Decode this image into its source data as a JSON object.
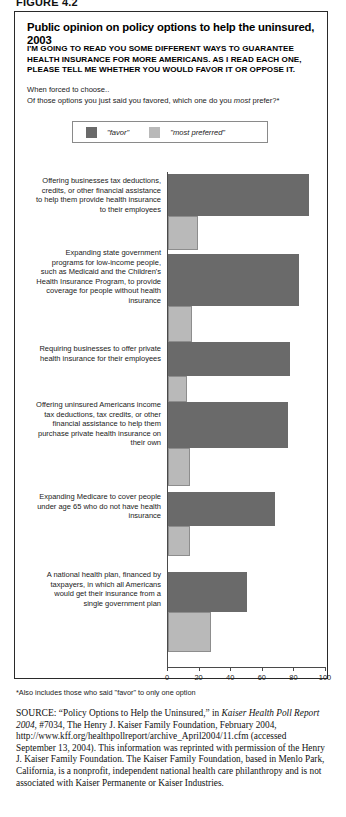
{
  "figure_tag": "FIGURE 4.2",
  "panel": {
    "title": "Public opinion on policy options to help the uninsured, 2003",
    "subtitle": "I'M GOING TO READ YOU SOME DIFFERENT WAYS TO GUARANTEE HEALTH INSURANCE FOR MORE AMERICANS. AS I READ EACH ONE, PLEASE TELL ME WHETHER YOU WOULD FAVOR IT OR OPPOSE IT.",
    "intro_line1": "When forced to choose..",
    "intro_line2_a": "Of those options you just said you favored, which one do you ",
    "intro_line2_em": "most",
    "intro_line2_b": " prefer?*"
  },
  "legend": {
    "favor_label": "\"favor\"",
    "preferred_label": "\"most preferred\"",
    "favor_color": "#6a6a6a",
    "preferred_color": "#b9b9b9"
  },
  "footnote": "*Also includes those who said \"favor\" to only one option",
  "source": {
    "prefix": "SOURCE:",
    "text_1": " “Policy Options to Help the Uninsured,” in ",
    "italic_1": "Kaiser Health Poll Report 2004",
    "text_2": ", #7034, The Henry J. Kaiser Family Foundation, February 2004, http://www.kff.org/healthpollreport/archive_April2004/11.cfm (accessed September 13, 2004). This information was reprinted with permission of the Henry J. Kaiser Family Foundation. The Kaiser Family Foundation, based in Menlo Park, California, is a nonprofit, independent national health care philanthropy and is not associated with Kaiser Permanente or Kaiser Industries."
  },
  "chart_data": {
    "type": "bar",
    "orientation": "horizontal",
    "title": "Public opinion on policy options to help the uninsured, 2003",
    "xlabel": "",
    "ylabel": "",
    "xlim": [
      0,
      100
    ],
    "xticks": [
      0,
      20,
      40,
      60,
      80,
      100
    ],
    "grid": false,
    "legend_position": "top",
    "categories": [
      "Offering businesses tax deductions, credits, or other financial assistance to help them provide health insurance to their employees",
      "Expanding state government programs for low-income people, such as Medicaid and the Children's Health Insurance Program, to provide coverage for people without health insurance",
      "Requiring businesses to offer private health insurance for their employees",
      "Offering uninsured Americans income tax deductions, tax credits, or other financial assistance to help them purchase private health insurance on their own",
      "Expanding Medicare to cover people under age 65 who do not have health insurance",
      "A national health plan, financed by taxpayers, in which all Americans would get their insurance from a single government plan"
    ],
    "series": [
      {
        "name": "\"favor\"",
        "color": "#6a6a6a",
        "values": [
          89,
          83,
          77,
          76,
          68,
          50
        ]
      },
      {
        "name": "\"most preferred\"",
        "color": "#b9b9b9",
        "values": [
          19,
          15,
          12,
          14,
          14,
          27
        ]
      }
    ]
  }
}
